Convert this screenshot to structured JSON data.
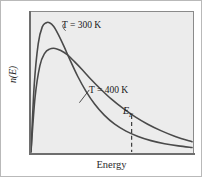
{
  "figure": {
    "y_axis_label": "n(E)",
    "x_axis_label": "Energy",
    "fermi_label_symbol": "E",
    "fermi_label_subscript": "F",
    "series_labels": {
      "cold": "T = 300 K",
      "hot": "T = 400 K"
    },
    "colors": {
      "plot_background": "#ececec",
      "page_background": "#ffffff",
      "frame_border": "#8a8a8a",
      "axis": "#6e6e6e",
      "curve": "#4a4a4a",
      "text": "#1a1a1a",
      "dashed_line": "#3a3a3a"
    }
  },
  "chart_data": {
    "type": "line",
    "title": "",
    "xlabel": "Energy",
    "ylabel": "n(E)",
    "grid": false,
    "legend_position": "inline-annotations",
    "xlim": [
      0,
      1
    ],
    "ylim": [
      0,
      1
    ],
    "axis_ticks": {
      "x": [],
      "y": []
    },
    "series": [
      {
        "name": "T = 300 K",
        "label": "T = 300 K",
        "temperature_K": 300,
        "color": "#4a4a4a",
        "peak": {
          "x": 0.115,
          "y": 0.93
        },
        "x": [
          0.0,
          0.02,
          0.045,
          0.07,
          0.095,
          0.115,
          0.14,
          0.17,
          0.205,
          0.245,
          0.29,
          0.34,
          0.395,
          0.455,
          0.52,
          0.59,
          0.665,
          0.745,
          0.83,
          0.915,
          1.0
        ],
        "y": [
          0.0,
          0.48,
          0.78,
          0.9,
          0.93,
          0.93,
          0.905,
          0.845,
          0.76,
          0.655,
          0.545,
          0.44,
          0.345,
          0.265,
          0.2,
          0.15,
          0.112,
          0.082,
          0.06,
          0.044,
          0.032
        ]
      },
      {
        "name": "T = 400 K",
        "label": "T = 400 K",
        "temperature_K": 400,
        "color": "#4a4a4a",
        "peak": {
          "x": 0.15,
          "y": 0.745
        },
        "x": [
          0.0,
          0.025,
          0.055,
          0.085,
          0.115,
          0.15,
          0.185,
          0.225,
          0.27,
          0.32,
          0.375,
          0.435,
          0.5,
          0.57,
          0.645,
          0.725,
          0.81,
          0.9,
          1.0
        ],
        "y": [
          0.0,
          0.39,
          0.62,
          0.71,
          0.74,
          0.745,
          0.73,
          0.7,
          0.65,
          0.59,
          0.52,
          0.45,
          0.38,
          0.315,
          0.255,
          0.2,
          0.152,
          0.11,
          0.074
        ]
      }
    ],
    "annotations": [
      {
        "name": "fermi-energy-marker",
        "text": "E_F",
        "type": "vertical-dashed-line",
        "x": 0.625,
        "y_top": 0.265,
        "y_bottom": 0.0
      }
    ]
  }
}
